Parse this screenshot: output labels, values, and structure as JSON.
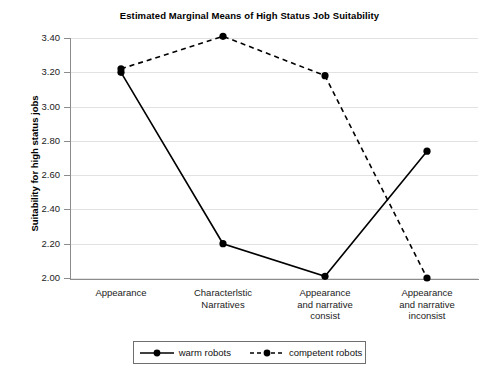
{
  "chart_data": {
    "type": "line",
    "title": "Estimated Marginal Means of High Status Job Suitability",
    "xlabel": "",
    "ylabel": "Suitability for high status jobs",
    "categories": [
      "Appearance",
      "Characterlstic Narratives",
      "Appearance and narrative consist",
      "Appearance and narrative inconsist"
    ],
    "category_lines": [
      [
        "Appearance"
      ],
      [
        "Characterlstic",
        "Narratives"
      ],
      [
        "Appearance",
        "and narrative",
        "consist"
      ],
      [
        "Appearance",
        "and narrative",
        "inconsist"
      ]
    ],
    "series": [
      {
        "name": "warm robots",
        "style": "solid",
        "values": [
          3.2,
          2.2,
          2.01,
          2.74
        ]
      },
      {
        "name": "competent robots",
        "style": "dashed",
        "values": [
          3.22,
          3.41,
          3.18,
          2.0
        ]
      }
    ],
    "ylim": [
      2.0,
      3.4
    ],
    "ytick_labels": [
      "3.40",
      "3.20",
      "3.00",
      "2.80",
      "2.60",
      "2.40",
      "2.20",
      "2.00"
    ],
    "ytick_values": [
      3.4,
      3.2,
      3.0,
      2.8,
      2.6,
      2.4,
      2.2,
      2.0
    ],
    "grid": true,
    "legend_position": "bottom",
    "marker": "filled-circle",
    "line_color": "#000000",
    "grid_color": "#e2e2e2",
    "axis_color": "#8c8c8c",
    "background": "#ffffff"
  },
  "legend": {
    "items": [
      {
        "label": "warm robots",
        "style": "solid"
      },
      {
        "label": "competent robots",
        "style": "dashed"
      }
    ]
  }
}
